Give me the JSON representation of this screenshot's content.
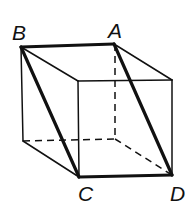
{
  "diagram": {
    "type": "cube-wireframe",
    "labels": {
      "A": "A",
      "B": "B",
      "C": "C",
      "D": "D"
    },
    "vertices": {
      "B": [
        21,
        47
      ],
      "A": [
        114,
        44
      ],
      "front_top_left": [
        78,
        81
      ],
      "front_top_right": [
        172,
        80
      ],
      "back_bottom_left": [
        23,
        141
      ],
      "back_bottom_right_hidden": [
        115,
        139
      ],
      "C": [
        79,
        177
      ],
      "D": [
        172,
        175
      ]
    },
    "highlighted_edges": [
      "BA",
      "BC",
      "AD",
      "CD"
    ],
    "colors": {
      "stroke": "#111111",
      "background": "#ffffff"
    }
  }
}
